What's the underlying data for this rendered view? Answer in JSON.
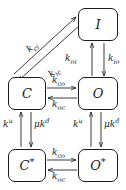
{
  "diagram": {
    "type": "state-transition-diagram",
    "background_color": "#ffffff",
    "stroke_color": "#1a1a1a",
    "nodes": [
      {
        "id": "I",
        "label": "I",
        "starred": false,
        "x": 78,
        "y": 8,
        "w": 40,
        "h": 33
      },
      {
        "id": "C",
        "label": "C",
        "starred": false,
        "x": 8,
        "y": 77,
        "w": 38,
        "h": 33
      },
      {
        "id": "O",
        "label": "O",
        "starred": false,
        "x": 78,
        "y": 77,
        "w": 40,
        "h": 33
      },
      {
        "id": "Cs",
        "label": "C",
        "starred": true,
        "x": 8,
        "y": 149,
        "w": 38,
        "h": 33
      },
      {
        "id": "Os",
        "label": "O",
        "starred": true,
        "x": 78,
        "y": 149,
        "w": 40,
        "h": 33
      }
    ],
    "edges": [
      {
        "id": "c-to-i",
        "from": "C",
        "to": "I",
        "rate": "k",
        "sub": "ci",
        "sup": "",
        "mu": false
      },
      {
        "id": "i-to-c",
        "from": "I",
        "to": "C",
        "rate": "k",
        "sub": "ic",
        "sup": "",
        "mu": false
      },
      {
        "id": "o-to-i",
        "from": "O",
        "to": "I",
        "rate": "k",
        "sub": "oi",
        "sup": "",
        "mu": false
      },
      {
        "id": "i-to-o",
        "from": "I",
        "to": "O",
        "rate": "k",
        "sub": "io",
        "sup": "",
        "mu": false
      },
      {
        "id": "c-to-o",
        "from": "C",
        "to": "O",
        "rate": "k",
        "sub": "co",
        "sup": "",
        "mu": false
      },
      {
        "id": "o-to-c",
        "from": "O",
        "to": "C",
        "rate": "k",
        "sub": "oc",
        "sup": "",
        "mu": false
      },
      {
        "id": "cs-to-c",
        "from": "Cs",
        "to": "C",
        "rate": "k",
        "sub": "",
        "sup": "u",
        "mu": false
      },
      {
        "id": "c-to-cs",
        "from": "C",
        "to": "Cs",
        "rate": "k",
        "sub": "",
        "sup": "d",
        "mu": true
      },
      {
        "id": "os-to-o",
        "from": "Os",
        "to": "O",
        "rate": "k",
        "sub": "",
        "sup": "u",
        "mu": false
      },
      {
        "id": "o-to-os",
        "from": "O",
        "to": "Os",
        "rate": "k",
        "sub": "",
        "sup": "d",
        "mu": true
      },
      {
        "id": "cs-to-os",
        "from": "Cs",
        "to": "Os",
        "rate": "k",
        "sub": "co",
        "sup": "",
        "mu": false
      },
      {
        "id": "os-to-cs",
        "from": "Os",
        "to": "Cs",
        "rate": "k",
        "sub": "oc",
        "sup": "",
        "mu": false
      }
    ],
    "labels": {
      "k_ci": {
        "text_k": "k",
        "sub": "ci"
      },
      "k_ic": {
        "text_k": "k",
        "sub": "ic"
      },
      "k_oi": {
        "text_k": "k",
        "sub": "oi"
      },
      "k_io": {
        "text_k": "k",
        "sub": "io"
      },
      "k_co_upper": {
        "text_k": "k",
        "sub": "co"
      },
      "k_oc_upper": {
        "text_k": "k",
        "sub": "oc"
      },
      "k_co_lower": {
        "text_k": "k",
        "sub": "co"
      },
      "k_oc_lower": {
        "text_k": "k",
        "sub": "oc"
      },
      "k_u_left": {
        "text_k": "k",
        "sup": "u"
      },
      "k_d_left": {
        "mu": "μ",
        "text_k": "k",
        "sup": "d"
      },
      "k_u_right": {
        "text_k": "k",
        "sup": "u"
      },
      "k_d_right": {
        "mu": "μ",
        "text_k": "k",
        "sup": "d"
      }
    },
    "node_text": {
      "I": "I",
      "C": "C",
      "O": "O",
      "C_star_base": "C",
      "C_star_mark": "*",
      "O_star_base": "O",
      "O_star_mark": "*"
    }
  }
}
